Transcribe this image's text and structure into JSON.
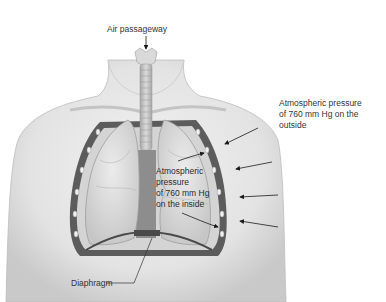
{
  "figure": {
    "labels": {
      "air_passageway": "Air passageway",
      "outside_line1": "Atmospheric pressure",
      "outside_line2": "of 760 mm Hg on the",
      "outside_line3": "outside",
      "inside_line1": "Atmospheric",
      "inside_line2": "pressure",
      "inside_line3": "of 760 mm Hg",
      "inside_line4": "on the inside",
      "diaphragm": "Diaphragm"
    },
    "arrows": {
      "outside_count": 4,
      "inside_count": 2
    },
    "colors": {
      "skin": "#e6e6e6",
      "skin_shadow": "#c8c8c8",
      "lung": "#dcdcdc",
      "rib_wall": "#555555",
      "trachea": "#bdbdbd",
      "mediastinum": "#8f8f8f",
      "text": "#333333"
    }
  }
}
